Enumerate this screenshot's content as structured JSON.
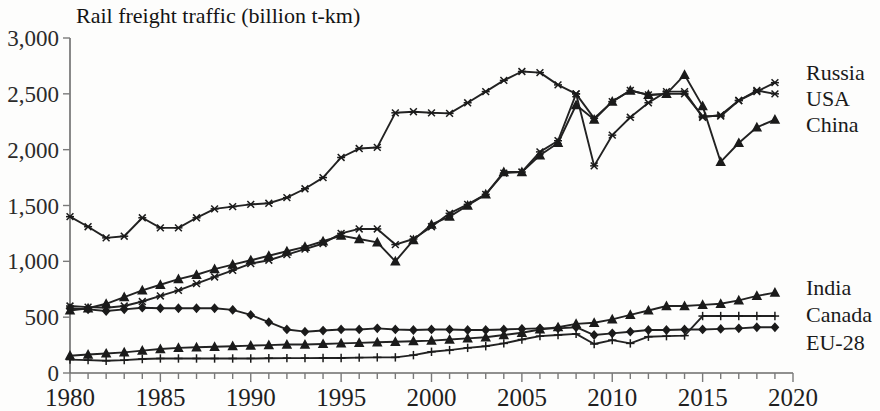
{
  "chart_data": {
    "type": "line",
    "title": "Rail freight traffic (billion t-km)",
    "xlabel": "",
    "ylabel": "",
    "xlim": [
      1980,
      2020
    ],
    "ylim": [
      0,
      3000
    ],
    "ytick_labels": [
      "0",
      "500",
      "1,000",
      "1,500",
      "2,000",
      "2,500",
      "3,000"
    ],
    "ytick_values": [
      0,
      500,
      1000,
      1500,
      2000,
      2500,
      3000
    ],
    "xtick_labels": [
      "1980",
      "1985",
      "1990",
      "1995",
      "2000",
      "2005",
      "2010",
      "2015",
      "2020"
    ],
    "xtick_values": [
      1980,
      1985,
      1990,
      1995,
      2000,
      2005,
      2010,
      2015,
      2020
    ],
    "x_minor_tick_step": 1,
    "grid": false,
    "legend_position": "right-inline-labels",
    "x": [
      1980,
      1981,
      1982,
      1983,
      1984,
      1985,
      1986,
      1987,
      1988,
      1989,
      1990,
      1991,
      1992,
      1993,
      1994,
      1995,
      1996,
      1997,
      1998,
      1999,
      2000,
      2001,
      2002,
      2003,
      2004,
      2005,
      2006,
      2007,
      2008,
      2009,
      2010,
      2011,
      2012,
      2013,
      2014,
      2015,
      2016,
      2017,
      2018,
      2019
    ],
    "series": [
      {
        "name": "USA",
        "marker": "cross-x",
        "values": [
          1400,
          1310,
          1210,
          1225,
          1390,
          1300,
          1300,
          1390,
          1470,
          1490,
          1510,
          1520,
          1570,
          1650,
          1750,
          1930,
          2010,
          2020,
          2330,
          2340,
          2330,
          2325,
          2420,
          2520,
          2620,
          2700,
          2690,
          2580,
          2500,
          1855,
          2130,
          2290,
          2420,
          2520,
          2520,
          2290,
          2310,
          2440,
          2530,
          2500
        ]
      },
      {
        "name": "China",
        "marker": "triangle",
        "values": [
          560,
          580,
          620,
          680,
          740,
          790,
          840,
          880,
          930,
          970,
          1010,
          1050,
          1090,
          1130,
          1180,
          1230,
          1200,
          1170,
          1000,
          1190,
          1330,
          1400,
          1500,
          1600,
          1800,
          1800,
          1950,
          2060,
          2400,
          2270,
          2430,
          2530,
          2490,
          2500,
          2670,
          2390,
          1890,
          2060,
          2200,
          2270
        ]
      },
      {
        "name": "Russia",
        "marker": "cross-x",
        "values": [
          600,
          590,
          585,
          600,
          640,
          690,
          740,
          800,
          860,
          920,
          980,
          1010,
          1060,
          1110,
          1160,
          1250,
          1290,
          1290,
          1150,
          1200,
          1310,
          1430,
          1510,
          1600,
          1790,
          1800,
          1980,
          2080,
          2500,
          2280,
          2430,
          2530,
          2490,
          2500,
          2500,
          2300,
          2300,
          2440,
          2520,
          2600
        ]
      },
      {
        "name": "India",
        "marker": "triangle",
        "values": [
          155,
          165,
          175,
          185,
          200,
          215,
          225,
          230,
          235,
          240,
          245,
          250,
          255,
          255,
          260,
          265,
          270,
          275,
          280,
          285,
          290,
          300,
          310,
          320,
          340,
          360,
          390,
          410,
          440,
          450,
          480,
          520,
          560,
          600,
          600,
          610,
          620,
          650,
          690,
          720
        ]
      },
      {
        "name": "Canada",
        "marker": "diamond",
        "values": [
          580,
          570,
          555,
          570,
          585,
          580,
          580,
          580,
          580,
          565,
          520,
          455,
          390,
          370,
          380,
          390,
          390,
          400,
          390,
          385,
          390,
          390,
          385,
          385,
          390,
          395,
          400,
          400,
          410,
          340,
          355,
          370,
          385,
          385,
          390,
          390,
          395,
          400,
          410,
          410
        ]
      },
      {
        "name": "EU-28",
        "marker": "plus",
        "values": [
          120,
          115,
          110,
          115,
          125,
          130,
          130,
          130,
          130,
          130,
          130,
          132,
          133,
          133,
          135,
          135,
          138,
          140,
          140,
          160,
          190,
          205,
          225,
          240,
          265,
          300,
          330,
          340,
          350,
          260,
          295,
          265,
          325,
          330,
          335,
          510,
          510,
          510,
          510,
          510
        ]
      }
    ]
  },
  "labels": {
    "right_top": [
      "Russia",
      "USA",
      "China"
    ],
    "right_bottom": [
      "India",
      "Canada",
      "EU-28"
    ]
  },
  "colors": {
    "line": "#1b1b1b",
    "axis": "#6b6b6b",
    "text": "#1a1a1a",
    "background": "#fdfdfc"
  }
}
